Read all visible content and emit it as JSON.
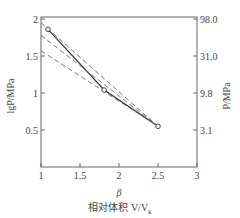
{
  "chart_data": {
    "type": "line",
    "title": "",
    "xlabel": "β",
    "xlabel_sub": "相对体积 V/V",
    "xlabel_sub_subscript": "k",
    "ylabel_left": "lgP/MPa",
    "ylabel_right": "P/MPa",
    "xlim": [
      1,
      3
    ],
    "ylim": [
      0,
      2
    ],
    "x_ticks": [
      1,
      1.5,
      2,
      2.5,
      3
    ],
    "x_tick_labels": [
      "1",
      "1.5",
      "2",
      "2.5",
      "3"
    ],
    "y_ticks_left": [
      0.5,
      1,
      1.5,
      2
    ],
    "y_tick_labels_left": [
      "0.5",
      "1",
      "1.5",
      "2"
    ],
    "y_ticks_right_positions": [
      0.5,
      1,
      1.5,
      2
    ],
    "y_tick_labels_right": [
      "3.1",
      "9.8",
      "31.0",
      "98.0"
    ],
    "grid": false,
    "series": [
      {
        "name": "measured",
        "style": "solid-with-circle-markers",
        "x": [
          1.09,
          1.81,
          2.5
        ],
        "y": [
          1.86,
          1.04,
          0.55
        ]
      },
      {
        "name": "dashed-1",
        "style": "dashed",
        "x": [
          1.0,
          2.5
        ],
        "y": [
          1.95,
          0.55
        ]
      },
      {
        "name": "dashed-2",
        "style": "dashed",
        "x": [
          1.0,
          2.5
        ],
        "y": [
          1.78,
          0.55
        ]
      },
      {
        "name": "dashed-3",
        "style": "dashed",
        "x": [
          1.0,
          2.5
        ],
        "y": [
          1.57,
          0.55
        ]
      }
    ]
  }
}
